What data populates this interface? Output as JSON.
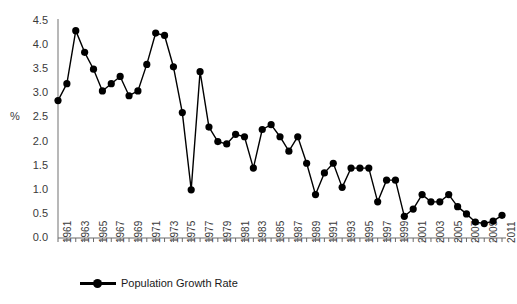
{
  "chart_data": {
    "type": "line",
    "title": "",
    "xlabel": "",
    "ylabel": "%",
    "ylim": [
      0.0,
      4.5
    ],
    "ytick_values": [
      0.0,
      0.5,
      1.0,
      1.5,
      2.0,
      2.5,
      3.0,
      3.5,
      4.0,
      4.5
    ],
    "ytick_labels": [
      "0.0",
      "0.5",
      "1.0",
      "1.5",
      "2.0",
      "2.5",
      "3.0",
      "3.5",
      "4.0",
      "4.5"
    ],
    "grid": false,
    "legend": {
      "position": "bottom-left",
      "entries": [
        "Population Growth Rate"
      ]
    },
    "marker": "filled-circle",
    "line_color": "#000000",
    "marker_color": "#000000",
    "x": [
      1961,
      1962,
      1963,
      1964,
      1965,
      1966,
      1967,
      1968,
      1969,
      1970,
      1971,
      1972,
      1973,
      1974,
      1975,
      1976,
      1977,
      1978,
      1979,
      1980,
      1981,
      1982,
      1983,
      1984,
      1985,
      1986,
      1987,
      1988,
      1989,
      1990,
      1991,
      1992,
      1993,
      1994,
      1995,
      1996,
      1997,
      1998,
      1999,
      2000,
      2001,
      2002,
      2003,
      2004,
      2005,
      2006,
      2007,
      2008,
      2009,
      2010,
      2011
    ],
    "xtick_labels": [
      "1961",
      "1963",
      "1965",
      "1967",
      "1969",
      "1971",
      "1973",
      "1975",
      "1977",
      "1979",
      "1981",
      "1983",
      "1985",
      "1987",
      "1989",
      "1991",
      "1993",
      "1995",
      "1997",
      "1999",
      "2001",
      "2003",
      "2005",
      "2007",
      "2009",
      "2011"
    ],
    "series": [
      {
        "name": "Population Growth Rate",
        "values": [
          2.85,
          3.2,
          4.3,
          3.85,
          3.5,
          3.05,
          3.2,
          3.35,
          2.95,
          3.05,
          3.6,
          4.25,
          4.2,
          3.55,
          2.6,
          1.0,
          3.45,
          2.3,
          2.0,
          1.95,
          2.15,
          2.1,
          1.45,
          2.25,
          2.35,
          2.1,
          1.8,
          2.1,
          1.55,
          0.9,
          1.35,
          1.55,
          1.05,
          1.45,
          1.45,
          1.45,
          0.75,
          1.2,
          1.2,
          0.45,
          0.6,
          0.9,
          0.75,
          0.75,
          0.9,
          0.65,
          0.5,
          0.33,
          0.3,
          0.35,
          0.47
        ]
      }
    ]
  },
  "axis": {
    "y_axis_title": "%"
  }
}
